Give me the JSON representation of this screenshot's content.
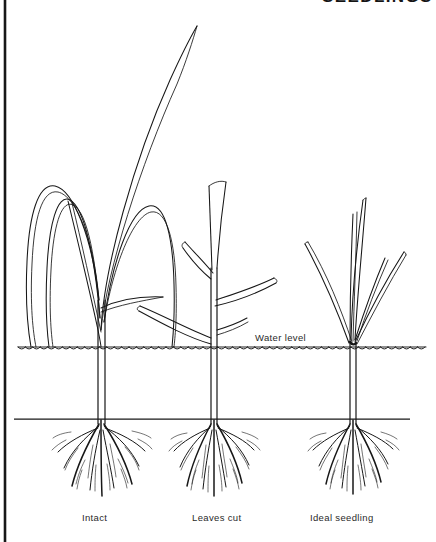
{
  "figure": {
    "kind": "botanical-line-drawing",
    "background_color": "#ffffff",
    "ink_color": "#171717",
    "width": 436,
    "height": 542
  },
  "title": {
    "text": "SEEDLINGS",
    "visible": "partially cropped at top edge",
    "x": 322,
    "y": 2
  },
  "frame": {
    "left_border": {
      "x": 5,
      "y_top": 0,
      "y_bottom": 542,
      "color": "#171717"
    }
  },
  "water_line": {
    "label": "Water level",
    "label_x": 255,
    "label_y": 341,
    "y": 347,
    "x_start": 18,
    "x_end": 426,
    "style": "horizontal rule with scalloped wavelets below"
  },
  "soil_line": {
    "y": 419,
    "x_start": 14,
    "x_end": 410,
    "style": "straight horizontal rule"
  },
  "plants": [
    {
      "id": "plant-intact",
      "label": "Intact",
      "label_x": 82,
      "label_y": 521,
      "stem_x": 101,
      "crown_y": 347,
      "description": "Tall seedling with long uncut leaves arching over into wide loops; one very long leaf extends to the top of the frame",
      "leaf_count": 6,
      "leaf_tip": "pointed",
      "tallest_leaf_top_y": 24,
      "root_spread": 50,
      "root_depth": 72
    },
    {
      "id": "plant-leaves-cut",
      "label": "Leaves cut",
      "label_x": 192,
      "label_y": 521,
      "stem_x": 214,
      "crown_y": 347,
      "description": "Seedling with leaf blades trimmed off, leaving short blunt-ended stubs angled outward",
      "leaf_count": 5,
      "leaf_tip": "blunt cut",
      "tallest_leaf_top_y": 180,
      "root_spread": 44,
      "root_depth": 70
    },
    {
      "id": "plant-ideal-seedling",
      "label": "Ideal seedling",
      "label_x": 310,
      "label_y": 521,
      "stem_x": 352,
      "crown_y": 345,
      "description": "Compact young seedling with straight, erect, pointed leaves fanning upward from the crown",
      "leaf_count": 5,
      "leaf_tip": "pointed",
      "tallest_leaf_top_y": 196,
      "root_spread": 46,
      "root_depth": 68
    }
  ],
  "captions": [
    {
      "text": "Intact",
      "x": 82,
      "y": 521
    },
    {
      "text": "Leaves cut",
      "x": 192,
      "y": 521
    },
    {
      "text": "Ideal seedling",
      "x": 310,
      "y": 521
    }
  ]
}
